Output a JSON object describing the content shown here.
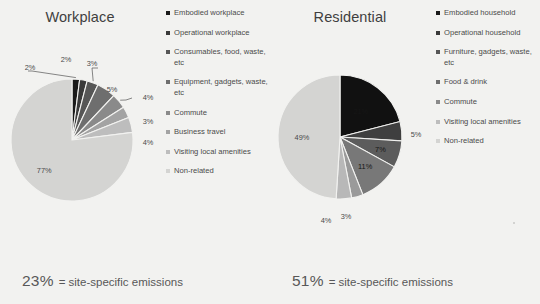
{
  "slide": {
    "background": "#f2f2f0"
  },
  "charts": [
    {
      "id": "workplace",
      "title": "Workplace",
      "footnote_value": "23%",
      "footnote_text": "= site-specific emissions",
      "legend": [
        {
          "label": "Embodied workplace",
          "color": "#1a1a1a"
        },
        {
          "label": "Operational workplace",
          "color": "#3a3a3a"
        },
        {
          "label": "Consumables, food, waste, etc",
          "color": "#565656"
        },
        {
          "label": "Equipment, gadgets, waste, etc",
          "color": "#6e6e6e"
        },
        {
          "label": "Commute",
          "color": "#8a8a8a"
        },
        {
          "label": "Business travel",
          "color": "#a3a3a3"
        },
        {
          "label": "Visiting local amenities",
          "color": "#bdbdbd"
        },
        {
          "label": "Non-related",
          "color": "#d4d4d2"
        }
      ],
      "chart_data": {
        "type": "pie",
        "title": "Workplace",
        "categories": [
          "Embodied workplace",
          "Operational workplace",
          "Consumables, food, waste, etc",
          "Equipment, gadgets, waste, etc",
          "Commute",
          "Business travel",
          "Visiting local amenities",
          "Non-related"
        ],
        "values": [
          2,
          2,
          3,
          5,
          4,
          3,
          4,
          77
        ],
        "labels": [
          "2%",
          "2%",
          "3%",
          "5%",
          "4%",
          "3%",
          "4%",
          "77%"
        ],
        "colors": [
          "#1a1a1a",
          "#3a3a3a",
          "#565656",
          "#6e6e6e",
          "#8a8a8a",
          "#a3a3a3",
          "#bdbdbd",
          "#d4d4d2"
        ],
        "unit": "%",
        "start_angle": 0,
        "legend_position": "right"
      }
    },
    {
      "id": "residential",
      "title": "Residential",
      "footnote_value": "51%",
      "footnote_text": "= site-specific emissions",
      "legend": [
        {
          "label": "Embodied household",
          "color": "#1a1a1a"
        },
        {
          "label": "Operational household",
          "color": "#3a3a3a"
        },
        {
          "label": "Furniture, gadgets, waste, etc",
          "color": "#565656"
        },
        {
          "label": "Food & drink",
          "color": "#6e6e6e"
        },
        {
          "label": "Commute",
          "color": "#8a8a8a"
        },
        {
          "label": "Visiting local amenities",
          "color": "#bdbdbd"
        },
        {
          "label": "Non-related",
          "color": "#d4d4d2"
        }
      ],
      "chart_data": {
        "type": "pie",
        "title": "Residential",
        "categories": [
          "Embodied household",
          "Operational household",
          "Furniture, gadgets, waste, etc",
          "Food & drink",
          "Commute",
          "Visiting local amenities",
          "Non-related"
        ],
        "values": [
          21,
          5,
          7,
          11,
          3,
          4,
          49
        ],
        "labels": [
          "21%",
          "5%",
          "7%",
          "11%",
          "3%",
          "4%",
          "49%"
        ],
        "colors": [
          "#111111",
          "#3f3f3f",
          "#5c5c5c",
          "#787878",
          "#9a9a9a",
          "#b8b8b8",
          "#d4d4d2"
        ],
        "unit": "%",
        "start_angle": 0,
        "legend_position": "right"
      }
    }
  ]
}
